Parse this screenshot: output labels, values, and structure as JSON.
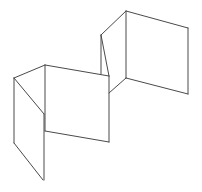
{
  "figure": {
    "stroke_color": "#4a4a4a",
    "background": "#ffffff",
    "panels": [
      {
        "name": "left-panel",
        "edges": [
          [
            14,
            78,
            45,
            65
          ],
          [
            14,
            78,
            44,
            114
          ],
          [
            14,
            78,
            14,
            143
          ],
          [
            14,
            143,
            43,
            180
          ],
          [
            44,
            114,
            44,
            180
          ]
        ]
      },
      {
        "name": "middle-panel",
        "edges": [
          [
            45,
            65,
            109,
            76
          ],
          [
            45,
            65,
            45,
            131
          ],
          [
            45,
            131,
            109,
            142
          ],
          [
            109,
            76,
            109,
            142
          ]
        ]
      },
      {
        "name": "upper-fold-panel",
        "edges": [
          [
            101,
            35,
            126,
            11
          ],
          [
            101,
            35,
            101,
            74
          ],
          [
            101,
            35,
            109,
            76
          ],
          [
            126,
            78,
            109,
            93
          ]
        ]
      },
      {
        "name": "right-panel",
        "edges": [
          [
            126,
            11,
            188,
            28
          ],
          [
            126,
            11,
            126,
            78
          ],
          [
            126,
            78,
            188,
            94
          ],
          [
            188,
            28,
            188,
            94
          ]
        ]
      }
    ]
  },
  "caption": {
    "text": ""
  }
}
